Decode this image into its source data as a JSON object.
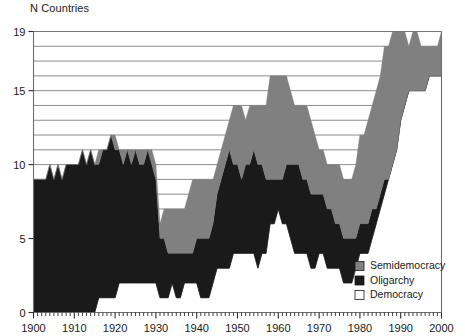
{
  "chart_data": {
    "type": "area",
    "title": "N Countries",
    "xlabel": "",
    "ylabel": "N Countries",
    "xlim": [
      1900,
      2000
    ],
    "ylim": [
      0,
      19
    ],
    "grid": true,
    "grid_orientation": "horizontal",
    "grid_step": 1,
    "legend_position": "bottom-right",
    "stacked": true,
    "stack_order_bottom_to_top": [
      "Democracy",
      "Oligarchy",
      "Semidemocracy"
    ],
    "y_tick_labels": [
      "0",
      "5",
      "10",
      "15",
      "19"
    ],
    "y_ticks": [
      0,
      5,
      10,
      15,
      19
    ],
    "x_tick_labels": [
      "1900",
      "1910",
      "1920",
      "1930",
      "1940",
      "1950",
      "1960",
      "1970",
      "1980",
      "1990",
      "2000"
    ],
    "x_ticks": [
      1900,
      1910,
      1920,
      1930,
      1940,
      1950,
      1960,
      1970,
      1980,
      1990,
      2000
    ],
    "x_minor_tick_step": 1,
    "colors": {
      "Semidemocracy": "#808080",
      "Oligarchy": "#1a1a1a",
      "Democracy": "#ffffff",
      "gridline": "#6f6f6f",
      "axis": "#6f6f6f",
      "text": "#1a1a1a"
    },
    "legend": [
      {
        "label": "Semidemocracy",
        "color": "#808080",
        "swatch": "filled-gray"
      },
      {
        "label": "Oligarchy",
        "color": "#1a1a1a",
        "swatch": "filled-black"
      },
      {
        "label": "Democracy",
        "color": "#ffffff",
        "swatch": "outline-white"
      }
    ],
    "x": [
      1900,
      1901,
      1902,
      1903,
      1904,
      1905,
      1906,
      1907,
      1908,
      1909,
      1910,
      1911,
      1912,
      1913,
      1914,
      1915,
      1916,
      1917,
      1918,
      1919,
      1920,
      1921,
      1922,
      1923,
      1924,
      1925,
      1926,
      1927,
      1928,
      1929,
      1930,
      1931,
      1932,
      1933,
      1934,
      1935,
      1936,
      1937,
      1938,
      1939,
      1940,
      1941,
      1942,
      1943,
      1944,
      1945,
      1946,
      1947,
      1948,
      1949,
      1950,
      1951,
      1952,
      1953,
      1954,
      1955,
      1956,
      1957,
      1958,
      1959,
      1960,
      1961,
      1962,
      1963,
      1964,
      1965,
      1966,
      1967,
      1968,
      1969,
      1970,
      1971,
      1972,
      1973,
      1974,
      1975,
      1976,
      1977,
      1978,
      1979,
      1980,
      1981,
      1982,
      1983,
      1984,
      1985,
      1986,
      1987,
      1988,
      1989,
      1990,
      1991,
      1992,
      1993,
      1994,
      1995,
      1996,
      1997,
      1998,
      1999,
      2000
    ],
    "series": [
      {
        "name": "Democracy",
        "color": "#ffffff",
        "values": [
          0,
          0,
          0,
          0,
          0,
          0,
          0,
          0,
          0,
          0,
          0,
          0,
          0,
          0,
          0,
          0,
          1,
          1,
          1,
          1,
          1,
          2,
          2,
          2,
          2,
          2,
          2,
          2,
          2,
          2,
          2,
          1,
          1,
          1,
          2,
          1,
          1,
          2,
          2,
          2,
          2,
          1,
          1,
          1,
          2,
          3,
          3,
          3,
          3,
          4,
          4,
          4,
          4,
          4,
          4,
          3,
          4,
          4,
          6,
          6,
          7,
          6,
          6,
          5,
          4,
          4,
          4,
          4,
          3,
          3,
          4,
          4,
          3,
          3,
          3,
          3,
          2,
          2,
          2,
          3,
          4,
          4,
          4,
          5,
          6,
          7,
          8,
          9,
          10,
          11,
          13,
          14,
          15,
          15,
          15,
          15,
          15,
          16,
          16,
          16,
          16
        ]
      },
      {
        "name": "Oligarchy",
        "color": "#1a1a1a",
        "values": [
          9,
          9,
          9,
          9,
          10,
          9,
          10,
          9,
          10,
          10,
          10,
          10,
          11,
          10,
          11,
          10,
          9,
          10,
          10,
          11,
          10,
          9,
          8,
          9,
          8,
          9,
          8,
          8,
          9,
          8,
          7,
          4,
          4,
          3,
          2,
          3,
          3,
          2,
          2,
          2,
          3,
          4,
          4,
          4,
          4,
          5,
          6,
          7,
          8,
          6,
          6,
          5,
          6,
          6,
          7,
          7,
          6,
          5,
          3,
          3,
          2,
          3,
          4,
          5,
          6,
          6,
          5,
          5,
          5,
          5,
          4,
          4,
          4,
          4,
          3,
          3,
          3,
          3,
          3,
          2,
          2,
          2,
          2,
          2,
          1,
          1,
          1,
          0,
          0,
          0,
          0,
          0,
          0,
          0,
          0,
          0,
          0,
          0,
          0,
          0,
          0
        ]
      },
      {
        "name": "Semidemocracy",
        "color": "#808080",
        "values": [
          0,
          0,
          0,
          0,
          0,
          0,
          0,
          0,
          0,
          0,
          0,
          0,
          0,
          0,
          0,
          0,
          1,
          0,
          0,
          0,
          1,
          0,
          1,
          0,
          1,
          0,
          1,
          1,
          0,
          1,
          1,
          1,
          2,
          3,
          3,
          3,
          3,
          3,
          4,
          5,
          4,
          4,
          4,
          4,
          3,
          2,
          2,
          2,
          2,
          4,
          4,
          5,
          3,
          4,
          3,
          4,
          4,
          5,
          7,
          7,
          7,
          7,
          6,
          5,
          4,
          4,
          5,
          5,
          5,
          4,
          3,
          3,
          3,
          3,
          4,
          4,
          4,
          4,
          4,
          5,
          6,
          6,
          7,
          7,
          8,
          8,
          9,
          9,
          9,
          8,
          6,
          5,
          3,
          4,
          4,
          3,
          3,
          2,
          2,
          2,
          3
        ]
      }
    ]
  }
}
